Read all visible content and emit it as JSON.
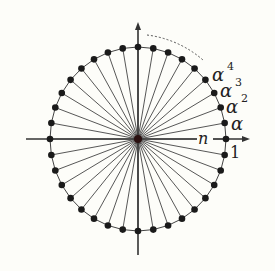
{
  "diagram": {
    "point_count": 36,
    "labels": {
      "axis_label": "n",
      "one": "1",
      "alpha1": "α",
      "alpha2": "α",
      "alpha2_exp": "2",
      "alpha3": "α",
      "alpha3_exp": "3",
      "alpha4": "α",
      "alpha4_exp": "4"
    },
    "colors": {
      "line": "#444444",
      "point": "#1a1a1a",
      "background": "#fdfdf9"
    }
  }
}
